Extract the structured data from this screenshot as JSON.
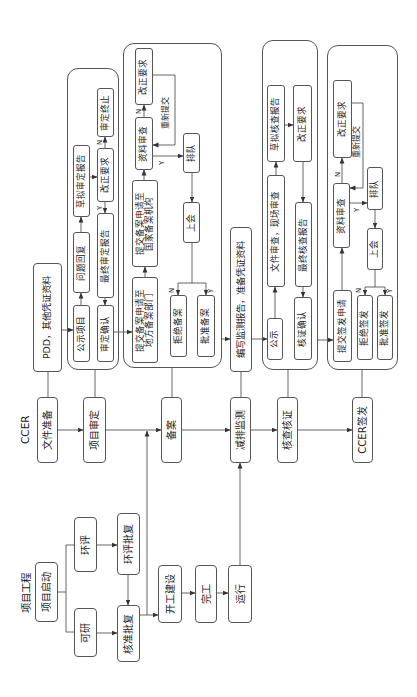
{
  "lanes": {
    "project": "项目工程",
    "ccer": "CCER"
  },
  "project": {
    "start": "项目启动",
    "feasibility": "可研",
    "eia": "环评",
    "approval": "核准批复",
    "eia_approval": "环评批复",
    "construction": "开工建设",
    "completion": "完工",
    "operation": "运行"
  },
  "ccer": {
    "doc_prep": "文件准备",
    "validation": "项目审定",
    "registration": "备案",
    "monitoring": "减排监测",
    "verification": "核查核证",
    "issuance": "CCER签发"
  },
  "docs": {
    "pdd": "PDD，其他凭证资料",
    "monitoring_report": "编写监测报告，准备凭证资料"
  },
  "validation_group": {
    "publish": "公示项目",
    "reply": "问题回复",
    "draft_report": "草拟审定报告",
    "correction": "改正要求",
    "terminate": "审定终止",
    "final_report": "最终审定报告",
    "confirm": "审定确认",
    "no": "N",
    "yes": "Y"
  },
  "registration_group": {
    "submit_local": [
      "提交备案申请至",
      "地方备案部门"
    ],
    "submit_national": [
      "提交备案申请至",
      "国家备案机构"
    ],
    "review": "资料审查",
    "correction": "改正要求",
    "resubmit": "重新提交",
    "queue": "排队",
    "meeting": "上会",
    "reject": "拒绝备案",
    "approve": "批准备案",
    "review_no": "N",
    "review_yes": "Y",
    "meeting_no": "N",
    "meeting_yes": "Y"
  },
  "verification_group": {
    "publish": "公示",
    "review": "文件审查，现场审查",
    "draft_report": "草拟核查报告",
    "correction": "改正要求",
    "final_report": "最终核查报告",
    "confirm": "核证确认"
  },
  "issuance_group": {
    "submit": "提交签发申请",
    "review": "资料审查",
    "correction": "改正要求",
    "resubmit": "重新提交",
    "queue": "排队",
    "meeting": "上会",
    "reject": "拒绝签发",
    "approve": "批准签发",
    "review_no": "N",
    "review_yes": "Y",
    "meeting_no": "N",
    "meeting_yes": "Y"
  },
  "colors": {
    "stroke": "#555555",
    "text": "#222222",
    "background": "#ffffff"
  },
  "edges": [
    {
      "from": "项目启动",
      "to": "可研"
    },
    {
      "from": "项目启动",
      "to": "环评"
    },
    {
      "from": "可研",
      "to": "核准批复"
    },
    {
      "from": "环评",
      "to": "环评批复"
    },
    {
      "from": "环评批复",
      "to": "核准批复"
    },
    {
      "from": "核准批复",
      "to": "开工建设"
    },
    {
      "from": "核准批复",
      "to": "备案"
    },
    {
      "from": "开工建设",
      "to": "完工"
    },
    {
      "from": "完工",
      "to": "运行"
    },
    {
      "from": "运行",
      "to": "减排监测"
    },
    {
      "from": "文件准备",
      "to": "项目审定"
    },
    {
      "from": "项目审定",
      "to": "备案"
    },
    {
      "from": "备案",
      "to": "减排监测"
    },
    {
      "from": "减排监测",
      "to": "核查核证"
    },
    {
      "from": "核查核证",
      "to": "CCER签发"
    },
    {
      "from": "PDD，其他凭证资料",
      "to": "公示项目"
    },
    {
      "from": "公示项目",
      "to": "问题回复"
    },
    {
      "from": "问题回复",
      "to": "草拟审定报告"
    },
    {
      "from": "草拟审定报告",
      "to": "改正要求"
    },
    {
      "from": "改正要求",
      "to": "审定终止",
      "label": "N"
    },
    {
      "from": "改正要求",
      "to": "最终审定报告",
      "label": "Y"
    },
    {
      "from": "最终审定报告",
      "to": "审定确认"
    },
    {
      "from": "审定确认",
      "to": "提交备案申请至地方备案部门"
    },
    {
      "from": "提交备案申请至地方备案部门",
      "to": "提交备案申请至国家备案机构"
    },
    {
      "from": "提交备案申请至国家备案机构",
      "to": "资料审查"
    },
    {
      "from": "资料审查",
      "to": "改正要求",
      "label": "N"
    },
    {
      "from": "改正要求",
      "to": "资料审查",
      "label": "重新提交"
    },
    {
      "from": "资料审查",
      "to": "排队",
      "label": "Y"
    },
    {
      "from": "排队",
      "to": "上会"
    },
    {
      "from": "上会",
      "to": "拒绝备案",
      "label": "N"
    },
    {
      "from": "上会",
      "to": "批准备案",
      "label": "Y"
    },
    {
      "from": "批准备案",
      "to": "编写监测报告，准备凭证资料"
    },
    {
      "from": "编写监测报告，准备凭证资料",
      "to": "公示"
    },
    {
      "from": "公示",
      "to": "文件审查，现场审查"
    },
    {
      "from": "文件审查，现场审查",
      "to": "草拟核查报告"
    },
    {
      "from": "草拟核查报告",
      "to": "改正要求"
    },
    {
      "from": "改正要求",
      "to": "最终核查报告"
    },
    {
      "from": "最终核查报告",
      "to": "核证确认"
    },
    {
      "from": "核证确认",
      "to": "提交签发申请"
    },
    {
      "from": "提交签发申请",
      "to": "资料审查"
    },
    {
      "from": "资料审查",
      "to": "改正要求",
      "label": "N"
    },
    {
      "from": "改正要求",
      "to": "资料审查",
      "label": "重新提交"
    },
    {
      "from": "资料审查",
      "to": "排队",
      "label": "Y"
    },
    {
      "from": "排队",
      "to": "上会"
    },
    {
      "from": "上会",
      "to": "拒绝签发",
      "label": "N"
    },
    {
      "from": "上会",
      "to": "批准签发",
      "label": "Y"
    }
  ]
}
